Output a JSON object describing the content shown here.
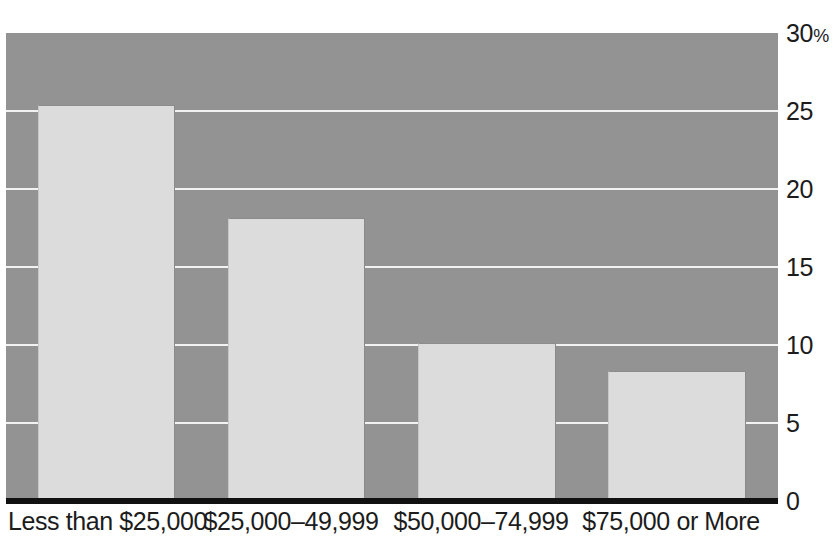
{
  "chart_data": {
    "type": "bar",
    "title": "",
    "subtitle": "",
    "xlabel": "",
    "ylabel": "",
    "categories": [
      "Less than $25,000",
      "$25,000–49,999",
      "$50,000–74,999",
      "$75,000 or More"
    ],
    "values": [
      25.4,
      18.1,
      10.1,
      8.3
    ],
    "ylim": [
      0,
      30
    ],
    "ytick_values": [
      0,
      5,
      10,
      15,
      20,
      25,
      30
    ],
    "ytick_labels": [
      "0",
      "5",
      "10",
      "15",
      "20",
      "25",
      "30%"
    ],
    "grid": true,
    "legend": "none",
    "annotations": []
  },
  "style": {
    "plot_background": "#939393",
    "bar_fill": "#dcdcdc",
    "gridline_color": "#f2f2f2",
    "axis_color": "#111111",
    "text_color": "#1c1c1c",
    "page_background": "#ffffff"
  }
}
